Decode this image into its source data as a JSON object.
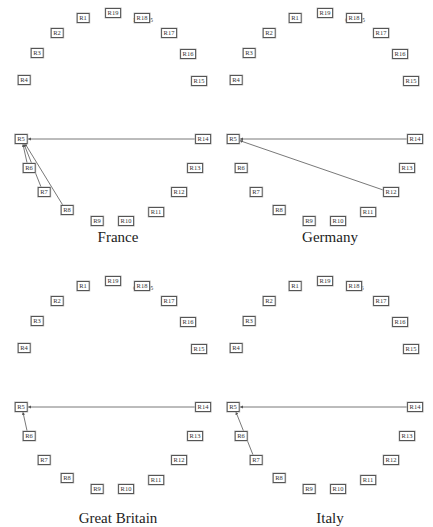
{
  "node_positions": {
    "R19": [
      113,
      13
    ],
    "R1": [
      83,
      18
    ],
    "R18": [
      142,
      18
    ],
    "R2": [
      57,
      33
    ],
    "R17": [
      169,
      33
    ],
    "R3": [
      37,
      53
    ],
    "R16": [
      188,
      54
    ],
    "R4": [
      24,
      80
    ],
    "R15": [
      199,
      81
    ],
    "R5": [
      21,
      139
    ],
    "R14": [
      203,
      139
    ],
    "R6": [
      29,
      168
    ],
    "R13": [
      195,
      168
    ],
    "R7": [
      44,
      192
    ],
    "R12": [
      179,
      192
    ],
    "R8": [
      67,
      210
    ],
    "R11": [
      156,
      212
    ],
    "R9": [
      97,
      221
    ],
    "R10": [
      126,
      221
    ]
  },
  "panels": [
    {
      "code": "FRA005",
      "country": "France",
      "offset": [
        0,
        0
      ],
      "title_y": 237,
      "edges": [
        [
          "R14",
          "R5"
        ],
        [
          "R6",
          "R5"
        ],
        [
          "R7",
          "R5"
        ],
        [
          "R8",
          "R5"
        ]
      ]
    },
    {
      "code": "GER005",
      "country": "Germany",
      "offset": [
        212,
        0
      ],
      "title_y": 237,
      "edges": [
        [
          "R14",
          "R5"
        ],
        [
          "R12",
          "R5"
        ]
      ]
    },
    {
      "code": "GBR005",
      "country": "Great Britain",
      "offset": [
        0,
        268
      ],
      "title_y": 250,
      "edges": [
        [
          "R14",
          "R5"
        ],
        [
          "R6",
          "R5"
        ]
      ]
    },
    {
      "code": "ITA005",
      "country": "Italy",
      "offset": [
        212,
        268
      ],
      "title_y": 250,
      "edges": [
        [
          "R14",
          "R5"
        ],
        [
          "R7",
          "R5"
        ]
      ]
    }
  ],
  "node_order": [
    "R1",
    "R2",
    "R3",
    "R4",
    "R5",
    "R6",
    "R7",
    "R8",
    "R9",
    "R10",
    "R11",
    "R12",
    "R13",
    "R14",
    "R15",
    "R16",
    "R17",
    "R18",
    "R19"
  ],
  "colors": {
    "edge": "#555555",
    "node_border": "#555555",
    "text": "#222222"
  }
}
